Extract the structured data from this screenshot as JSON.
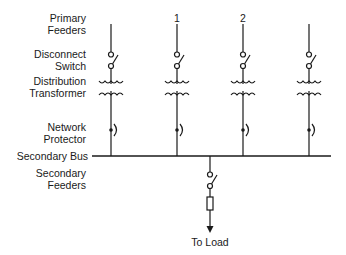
{
  "diagram": {
    "labels": {
      "primary_feeders": [
        "Primary",
        "Feeders"
      ],
      "disconnect_switch": [
        "Disconnect",
        "Switch"
      ],
      "distribution_transformer": [
        "Distribution",
        "Transformer"
      ],
      "network_protector": [
        "Network",
        "Protector"
      ],
      "secondary_bus": "Secondary Bus",
      "secondary_feeders": [
        "Secondary",
        "Feeders"
      ],
      "to_load": "To Load"
    },
    "feeder_numbers": [
      "",
      "1",
      "2",
      ""
    ],
    "feeders": [
      {
        "x": 111,
        "number": ""
      },
      {
        "x": 177,
        "number": "1"
      },
      {
        "x": 243,
        "number": "2"
      },
      {
        "x": 309,
        "number": ""
      }
    ],
    "components_per_feeder": [
      "line",
      "disconnect-switch",
      "transformer",
      "network-protector"
    ],
    "secondary_feeder_components": [
      "disconnect-switch",
      "fuse",
      "arrow"
    ],
    "colors": {
      "line": "#1a1a1a",
      "background": "#ffffff"
    }
  }
}
